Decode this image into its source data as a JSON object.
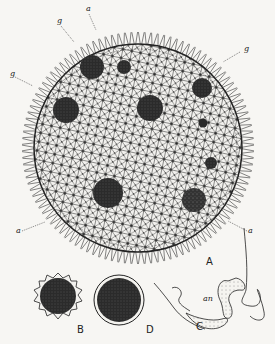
{
  "figure": {
    "panels": [
      {
        "id": "A",
        "label": "A",
        "description": "Whole colony with network of cells and daughter colonies"
      },
      {
        "id": "B",
        "label": "B",
        "description": "Spiny zygote"
      },
      {
        "id": "C",
        "label": "C",
        "description": "Flagellated cells"
      },
      {
        "id": "D",
        "label": "D",
        "description": "Smooth-walled spore"
      }
    ],
    "annotations": {
      "a_top": "a",
      "g_left_top": "g",
      "g_left": "g",
      "g_right": "g",
      "a_left": "a",
      "a_right": "a",
      "an": "an"
    },
    "colors": {
      "background": "#f7f6f3",
      "ink": "#1c1c1c",
      "dark_body": "#2a2a2a"
    }
  }
}
